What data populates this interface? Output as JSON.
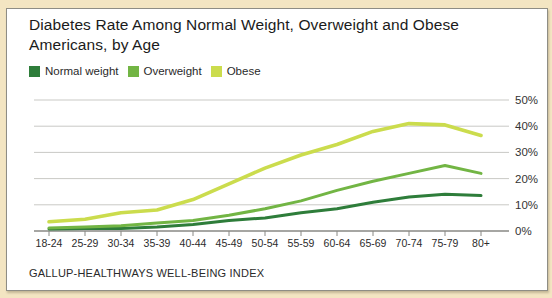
{
  "title": "Diabetes Rate Among Normal Weight, Overweight and Obese Americans, by Age",
  "footer": "GALLUP-HEALTHWAYS WELL-BEING INDEX",
  "colors": {
    "page_bg": "#f3e5c2",
    "card_bg": "#ffffff",
    "card_border": "#8e8d85",
    "grid": "#c9c9c5",
    "axis": "#888884",
    "title_text": "#1b1b1b",
    "tick_text": "#333333",
    "normal_weight": "#2e7d3a",
    "overweight": "#72b544",
    "obese": "#cbdc4d"
  },
  "legend": [
    {
      "label": "Normal weight",
      "color": "#2e7d3a"
    },
    {
      "label": "Overweight",
      "color": "#72b544"
    },
    {
      "label": "Obese",
      "color": "#cbdc4d"
    }
  ],
  "chart_data": {
    "type": "line",
    "title": "Diabetes Rate Among Normal Weight, Overweight and Obese Americans, by Age",
    "categories": [
      "18-24",
      "25-29",
      "30-34",
      "35-39",
      "40-44",
      "45-49",
      "50-54",
      "55-59",
      "60-64",
      "65-69",
      "70-74",
      "75-79",
      "80+"
    ],
    "series": [
      {
        "name": "Normal weight",
        "color": "#2e7d3a",
        "values": [
          0.8,
          1,
          1,
          1.5,
          2.5,
          4,
          5,
          7,
          8.5,
          11,
          13,
          14,
          13.5
        ]
      },
      {
        "name": "Overweight",
        "color": "#72b544",
        "values": [
          1.2,
          1.5,
          2,
          3,
          4,
          6,
          8.5,
          11.5,
          15.5,
          19,
          22,
          25,
          22
        ]
      },
      {
        "name": "Obese",
        "color": "#cbdc4d",
        "values": [
          3.5,
          4.5,
          7,
          8,
          12,
          18,
          24,
          29,
          33,
          38,
          41,
          40.5,
          36.5
        ]
      }
    ],
    "xlabel": "",
    "ylabel": "",
    "ylim": [
      0,
      50
    ],
    "ytick_step": 10,
    "ytick_labels": [
      "0%",
      "10%",
      "20%",
      "30%",
      "40%",
      "50%"
    ],
    "ytick_side": "right",
    "grid": true,
    "legend_position": "top-left",
    "source": "GALLUP-HEALTHWAYS WELL-BEING INDEX"
  }
}
